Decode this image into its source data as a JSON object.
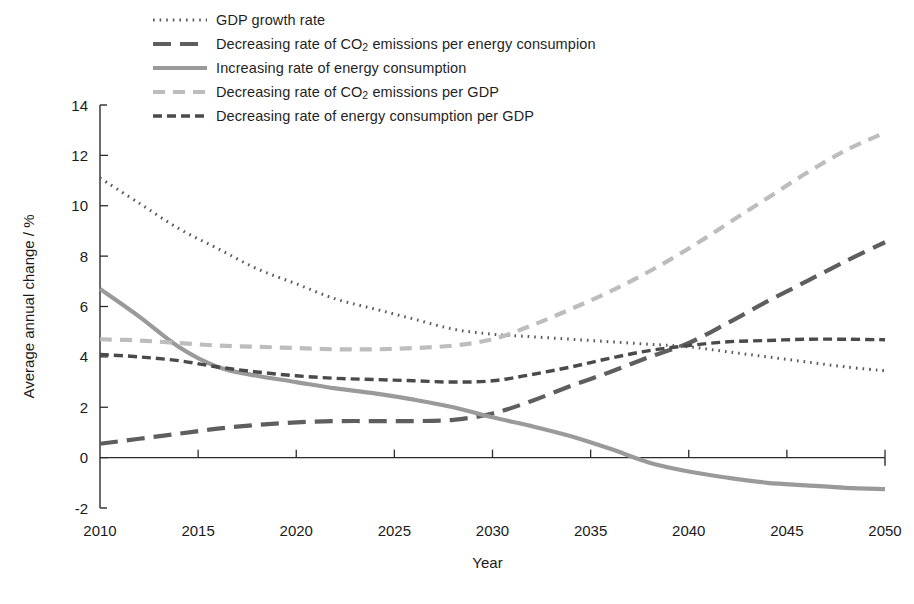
{
  "legend": {
    "position": "top-left",
    "items": [
      {
        "label": "GDP growth rate",
        "style": "dotted",
        "color": "#595959",
        "key": "gdp_growth"
      },
      {
        "label": "Decreasing rate of CO₂ emissions per energy consumpion",
        "style": "long-dash",
        "color": "#5e5e5e",
        "key": "co2_per_energy"
      },
      {
        "label": "Increasing rate of energy consumption",
        "style": "solid",
        "color": "#9a9a9a",
        "key": "energy_consumption"
      },
      {
        "label": "Decreasing rate of CO₂ emissions per GDP",
        "style": "medium-dash",
        "color": "#bdbdbd",
        "key": "co2_per_gdp"
      },
      {
        "label": "Decreasing rate of energy consumption per GDP",
        "style": "short-dash",
        "color": "#4a4a4a",
        "key": "energy_per_gdp"
      }
    ]
  },
  "axes": {
    "y_title": "Average annual change / %",
    "x_title": "Year",
    "y_ticks": [
      "-2",
      "0",
      "2",
      "4",
      "6",
      "8",
      "10",
      "12",
      "14"
    ],
    "x_ticks": [
      "2010",
      "2015",
      "2020",
      "2025",
      "2030",
      "2035",
      "2040",
      "2045",
      "2050"
    ]
  },
  "chart_data": {
    "type": "line",
    "title": "",
    "subtitle": "",
    "xlabel": "Year",
    "ylabel": "Average annual change / %",
    "xlim": [
      2010,
      2050
    ],
    "ylim": [
      -2,
      14
    ],
    "grid": false,
    "legend_position": "top-left",
    "x": [
      2010,
      2012,
      2014,
      2016,
      2018,
      2020,
      2022,
      2024,
      2026,
      2028,
      2030,
      2032,
      2034,
      2036,
      2038,
      2040,
      2042,
      2044,
      2046,
      2048,
      2050
    ],
    "series": [
      {
        "name": "GDP growth rate",
        "style": "dotted",
        "color": "#595959",
        "values": [
          11.1,
          10.1,
          9.1,
          8.3,
          7.5,
          6.9,
          6.3,
          5.9,
          5.5,
          5.1,
          4.9,
          4.8,
          4.7,
          4.6,
          4.5,
          4.4,
          4.2,
          4.0,
          3.8,
          3.6,
          3.45
        ]
      },
      {
        "name": "Decreasing rate of CO₂ emissions per energy consumpion",
        "style": "long-dash",
        "color": "#5e5e5e",
        "values": [
          0.55,
          0.75,
          0.95,
          1.15,
          1.3,
          1.4,
          1.45,
          1.45,
          1.45,
          1.5,
          1.75,
          2.25,
          2.85,
          3.4,
          4.0,
          4.55,
          5.35,
          6.2,
          7.0,
          7.8,
          8.55
        ]
      },
      {
        "name": "Increasing rate of energy consumption",
        "style": "solid",
        "color": "#9a9a9a",
        "values": [
          6.7,
          5.6,
          4.4,
          3.6,
          3.25,
          3.0,
          2.75,
          2.55,
          2.3,
          2.0,
          1.6,
          1.25,
          0.85,
          0.35,
          -0.2,
          -0.55,
          -0.8,
          -1.0,
          -1.1,
          -1.2,
          -1.25
        ]
      },
      {
        "name": "Decreasing rate of CO₂ emissions per GDP",
        "style": "medium-dash",
        "color": "#bdbdbd",
        "values": [
          4.7,
          4.65,
          4.55,
          4.45,
          4.4,
          4.35,
          4.3,
          4.3,
          4.35,
          4.45,
          4.7,
          5.25,
          5.9,
          6.6,
          7.4,
          8.3,
          9.3,
          10.3,
          11.3,
          12.2,
          12.9
        ]
      },
      {
        "name": "Decreasing rate of energy consumption per GDP",
        "style": "short-dash",
        "color": "#4a4a4a",
        "values": [
          4.1,
          4.0,
          3.85,
          3.6,
          3.4,
          3.25,
          3.15,
          3.1,
          3.05,
          3.0,
          3.05,
          3.3,
          3.6,
          3.95,
          4.25,
          4.45,
          4.6,
          4.65,
          4.7,
          4.7,
          4.68
        ]
      }
    ]
  }
}
